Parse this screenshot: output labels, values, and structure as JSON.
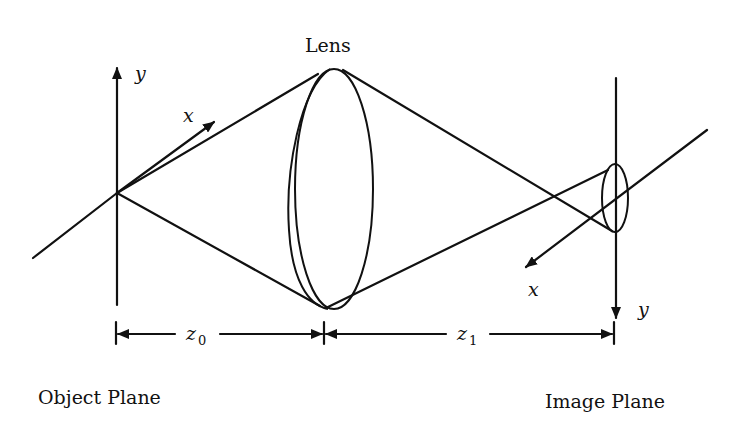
{
  "diagram": {
    "labels": {
      "lens": "Lens",
      "object_plane": "Object Plane",
      "image_plane": "Image Plane",
      "object_axis_x": "x",
      "object_axis_y": "y",
      "image_axis_x": "x",
      "image_axis_y": "y",
      "z0": "z",
      "z0_sub": "0",
      "z1": "z",
      "z1_sub": "1"
    },
    "colors": {
      "ink": "#111111",
      "background": "#ffffff"
    }
  }
}
